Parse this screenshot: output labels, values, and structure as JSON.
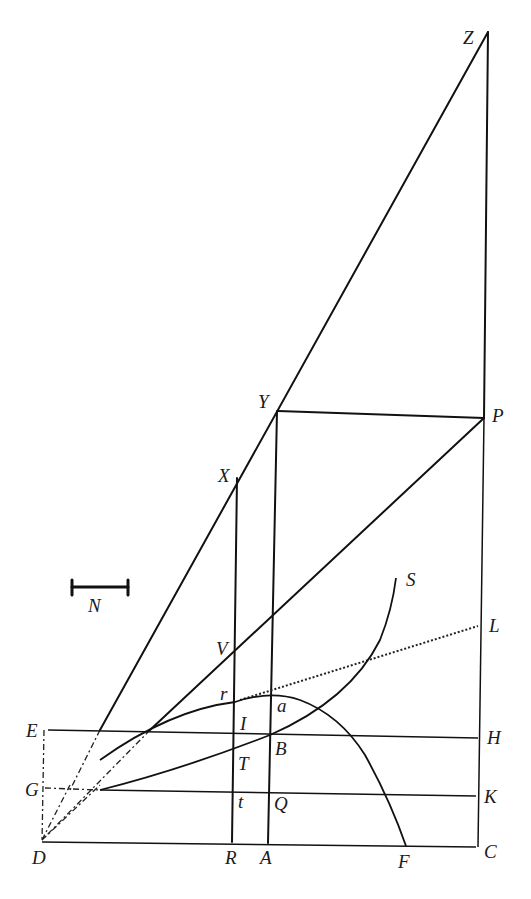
{
  "diagram": {
    "type": "geometric-construction",
    "background": "#ffffff",
    "ink": "#111111",
    "scale_bar": {
      "label": "N"
    },
    "points": {
      "Z": {
        "label": "Z",
        "x": 488,
        "y": 32
      },
      "Y": {
        "label": "Y",
        "x": 278,
        "y": 410
      },
      "P": {
        "label": "P",
        "x": 484,
        "y": 418
      },
      "X": {
        "label": "X",
        "x": 237,
        "y": 478
      },
      "V": {
        "label": "V",
        "x": 236,
        "y": 652
      },
      "L": {
        "label": "L",
        "x": 478,
        "y": 627
      },
      "S": {
        "label": "S",
        "x": 396,
        "y": 575
      },
      "r": {
        "label": "r",
        "x": 235,
        "y": 702
      },
      "a": {
        "label": "a",
        "x": 272,
        "y": 695
      },
      "E": {
        "label": "E",
        "x": 45,
        "y": 730
      },
      "I": {
        "label": "I",
        "x": 235,
        "y": 733
      },
      "B": {
        "label": "B",
        "x": 271,
        "y": 734
      },
      "H": {
        "label": "H",
        "x": 479,
        "y": 738
      },
      "T": {
        "label": "T",
        "x": 234,
        "y": 751
      },
      "G": {
        "label": "G",
        "x": 43,
        "y": 790
      },
      "t": {
        "label": "t",
        "x": 234,
        "y": 791
      },
      "Q": {
        "label": "Q",
        "x": 270,
        "y": 791
      },
      "K": {
        "label": "K",
        "x": 477,
        "y": 796
      },
      "D": {
        "label": "D",
        "x": 42,
        "y": 840
      },
      "R": {
        "label": "R",
        "x": 232,
        "y": 842
      },
      "A": {
        "label": "A",
        "x": 268,
        "y": 843
      },
      "F": {
        "label": "F",
        "x": 406,
        "y": 846
      },
      "C": {
        "label": "C",
        "x": 476,
        "y": 847
      }
    },
    "labels": [
      "Z",
      "Y",
      "P",
      "X",
      "N",
      "S",
      "V",
      "L",
      "r",
      "a",
      "E",
      "I",
      "B",
      "H",
      "T",
      "G",
      "t",
      "Q",
      "K",
      "D",
      "R",
      "A",
      "F",
      "C"
    ]
  }
}
